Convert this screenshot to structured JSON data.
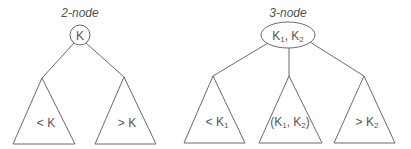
{
  "two_node": {
    "title": "2-node",
    "root_key": "K",
    "subtrees": [
      {
        "label_main": "< K",
        "label_sub": ""
      },
      {
        "label_main": "> K",
        "label_sub": ""
      }
    ]
  },
  "three_node": {
    "title": "3-node",
    "root_keys": {
      "k1": "K",
      "k1_sub": "1",
      "sep": ", ",
      "k2": "K",
      "k2_sub": "2"
    },
    "subtrees": [
      {
        "prefix": "< K",
        "sub": "1"
      },
      {
        "open": "(K",
        "sub1": "1",
        "mid": ", K",
        "sub2": "2",
        "close": ")"
      },
      {
        "prefix": "> K",
        "sub": "2"
      }
    ]
  }
}
